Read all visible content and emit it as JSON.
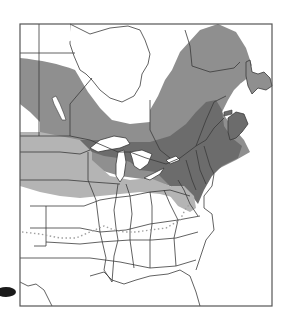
{
  "map": {
    "type": "species range map",
    "region": "Eastern North America",
    "colors": {
      "background": "#ffffff",
      "frame": "#555555",
      "border": "#3a3a3a",
      "water": "#ffffff",
      "range_light": "#b4b4b4",
      "range_medium": "#8f8f8f",
      "range_dark": "#6c6c6c",
      "dotted_line": "#a0a0a0",
      "arrow": "#1a1a1a"
    },
    "zones": [
      {
        "name": "northern-range",
        "shade": "medium"
      },
      {
        "name": "core-range",
        "shade": "dark"
      },
      {
        "name": "southern-fringe",
        "shade": "light"
      }
    ],
    "dotted_boundary": "southern limit line"
  }
}
